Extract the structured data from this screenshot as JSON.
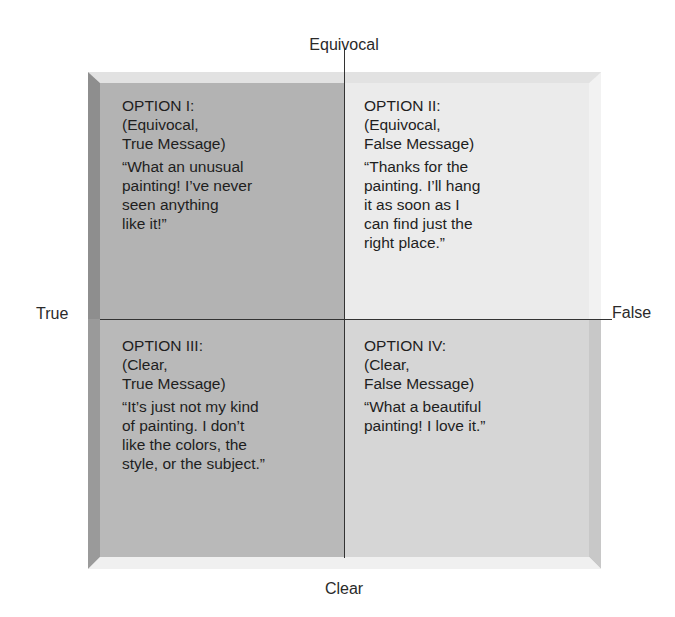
{
  "axes": {
    "top": "Equivocal",
    "bottom": "Clear",
    "left": "True",
    "right": "False"
  },
  "quadrants": [
    {
      "id": "I",
      "position": "top-left",
      "title_lines": [
        "OPTION I:",
        "(Equivocal,",
        "True Message)"
      ],
      "quote_lines": [
        "“What an unusual",
        "painting! I’ve never",
        "seen anything",
        "like it!”"
      ],
      "color": "#b3b3b3"
    },
    {
      "id": "II",
      "position": "top-right",
      "title_lines": [
        "OPTION II:",
        "(Equivocal,",
        "False Message)"
      ],
      "quote_lines": [
        "“Thanks for the",
        "painting. I’ll hang",
        "it as soon as I",
        "can find just the",
        "right place.”"
      ],
      "color": "#ebebeb"
    },
    {
      "id": "III",
      "position": "bottom-left",
      "title_lines": [
        "OPTION III:",
        "(Clear,",
        "True Message)"
      ],
      "quote_lines": [
        "“It’s just not my kind",
        "of painting. I don’t",
        "like the colors, the",
        "style, or the subject.”"
      ],
      "color": "#b9b9b9"
    },
    {
      "id": "IV",
      "position": "bottom-right",
      "title_lines": [
        "OPTION IV:",
        "(Clear,",
        "False Message)"
      ],
      "quote_lines": [
        "“What a beautiful",
        "painting! I love it.”"
      ],
      "color": "#d6d6d6"
    }
  ]
}
